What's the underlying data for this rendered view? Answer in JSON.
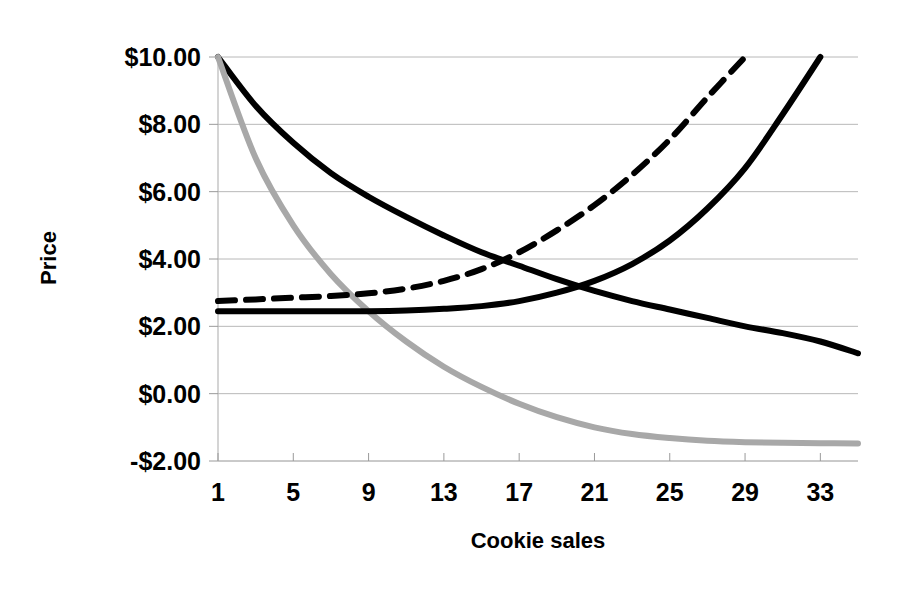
{
  "chart_data": {
    "type": "line",
    "title": "",
    "xlabel": "Cookie sales",
    "ylabel": "Price",
    "xlim": [
      1,
      35
    ],
    "ylim": [
      -2.0,
      10.0
    ],
    "grid": true,
    "legend": "none",
    "x_ticks": [
      "1",
      "5",
      "9",
      "13",
      "17",
      "21",
      "25",
      "29",
      "33"
    ],
    "x_tick_values": [
      1,
      5,
      9,
      13,
      17,
      21,
      25,
      29,
      33
    ],
    "y_ticks": [
      "-$2.00",
      "$0.00",
      "$2.00",
      "$4.00",
      "$6.00",
      "$8.00",
      "$10.00"
    ],
    "y_tick_values": [
      -2,
      0,
      2,
      4,
      6,
      8,
      10
    ],
    "x": [
      1,
      3,
      5,
      7,
      9,
      11,
      13,
      15,
      17,
      19,
      21,
      23,
      25,
      27,
      29,
      31,
      33,
      35
    ],
    "series": [
      {
        "name": "Demand",
        "style": "solid",
        "color": "#000000",
        "width": 6,
        "values": [
          10.0,
          8.55,
          7.45,
          6.55,
          5.85,
          5.25,
          4.7,
          4.2,
          3.8,
          3.4,
          3.05,
          2.75,
          2.5,
          2.25,
          2.0,
          1.8,
          1.55,
          1.2
        ]
      },
      {
        "name": "Marginal revenue",
        "style": "solid",
        "color": "#a8a8a8",
        "width": 6,
        "values": [
          10.0,
          7.0,
          5.0,
          3.55,
          2.45,
          1.55,
          0.8,
          0.2,
          -0.3,
          -0.7,
          -1.0,
          -1.2,
          -1.32,
          -1.4,
          -1.44,
          -1.46,
          -1.47,
          -1.48
        ]
      },
      {
        "name": "Marginal cost",
        "style": "solid",
        "color": "#000000",
        "width": 6,
        "values": [
          2.45,
          2.45,
          2.45,
          2.45,
          2.45,
          2.47,
          2.52,
          2.6,
          2.75,
          3.0,
          3.35,
          3.85,
          4.55,
          5.5,
          6.7,
          8.3,
          10.0,
          null
        ]
      },
      {
        "name": "Average total cost",
        "style": "dashed",
        "color": "#000000",
        "width": 6,
        "values": [
          2.75,
          2.8,
          2.85,
          2.9,
          2.98,
          3.12,
          3.35,
          3.7,
          4.2,
          4.85,
          5.6,
          6.5,
          7.55,
          8.8,
          10.0,
          null,
          null,
          null
        ]
      }
    ]
  },
  "axes": {
    "y_title": "Price",
    "x_title": "Cookie sales"
  }
}
